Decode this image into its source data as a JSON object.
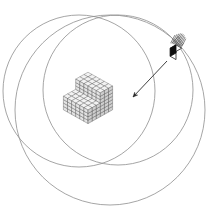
{
  "figure": {
    "title": "Three overlapping circles with voxel assembly and source cube",
    "background_color": "#ffffff",
    "width": 215,
    "height": 219,
    "caption": ""
  },
  "style": {
    "circle_stroke": "#8e8e8e",
    "circle_stroke_width": 0.8,
    "voxel_line": "#3c3c3c",
    "voxel_top_fill": "#f2f2f2",
    "voxel_left_fill": "#cfcfcf",
    "voxel_right_fill": "#e4e4e4",
    "small_cube_dark_face": "#0d0d0d",
    "small_cube_light_face": "#ffffff",
    "arrow_color": "#2b2b2b",
    "hatch_color": "#555555"
  },
  "circles": [
    {
      "name": "circle-upper-left",
      "cx": 79,
      "cy": 91,
      "r": 76
    },
    {
      "name": "circle-upper-right",
      "cx": 118,
      "cy": 90,
      "r": 75
    },
    {
      "name": "circle-lower-center",
      "cx": 110,
      "cy": 110,
      "r": 95
    }
  ],
  "voxel_assembly": {
    "name": "stepped-voxel-structure",
    "origin_x": 88,
    "origin_y": 96,
    "cell_w": 4.1,
    "cell_h": 2.3,
    "cell_z": 3.4,
    "description": "stepped L-shaped block of unit cubes",
    "columns": [
      {
        "grid_x": 0,
        "grid_y": 0,
        "height": 7
      },
      {
        "grid_x": 1,
        "grid_y": 0,
        "height": 7
      },
      {
        "grid_x": 2,
        "grid_y": 0,
        "height": 7
      },
      {
        "grid_x": 3,
        "grid_y": 0,
        "height": 7
      },
      {
        "grid_x": 4,
        "grid_y": 0,
        "height": 7
      },
      {
        "grid_x": 5,
        "grid_y": 0,
        "height": 7
      },
      {
        "grid_x": 0,
        "grid_y": 1,
        "height": 7
      },
      {
        "grid_x": 1,
        "grid_y": 1,
        "height": 7
      },
      {
        "grid_x": 2,
        "grid_y": 1,
        "height": 7
      },
      {
        "grid_x": 3,
        "grid_y": 1,
        "height": 7
      },
      {
        "grid_x": 4,
        "grid_y": 1,
        "height": 7
      },
      {
        "grid_x": 5,
        "grid_y": 1,
        "height": 7
      },
      {
        "grid_x": 0,
        "grid_y": 2,
        "height": 7
      },
      {
        "grid_x": 1,
        "grid_y": 2,
        "height": 7
      },
      {
        "grid_x": 2,
        "grid_y": 2,
        "height": 7
      },
      {
        "grid_x": 3,
        "grid_y": 2,
        "height": 7
      },
      {
        "grid_x": 4,
        "grid_y": 2,
        "height": 7
      },
      {
        "grid_x": 5,
        "grid_y": 2,
        "height": 7
      },
      {
        "grid_x": 0,
        "grid_y": 3,
        "height": 4
      },
      {
        "grid_x": 1,
        "grid_y": 3,
        "height": 4
      },
      {
        "grid_x": 2,
        "grid_y": 3,
        "height": 4
      },
      {
        "grid_x": 3,
        "grid_y": 3,
        "height": 4
      },
      {
        "grid_x": 4,
        "grid_y": 3,
        "height": 4
      },
      {
        "grid_x": 5,
        "grid_y": 3,
        "height": 4
      },
      {
        "grid_x": 0,
        "grid_y": 4,
        "height": 4
      },
      {
        "grid_x": 1,
        "grid_y": 4,
        "height": 4
      },
      {
        "grid_x": 2,
        "grid_y": 4,
        "height": 4
      },
      {
        "grid_x": 3,
        "grid_y": 4,
        "height": 4
      },
      {
        "grid_x": 4,
        "grid_y": 4,
        "height": 4
      },
      {
        "grid_x": 5,
        "grid_y": 4,
        "height": 4
      },
      {
        "grid_x": 0,
        "grid_y": 5,
        "height": 4
      },
      {
        "grid_x": 1,
        "grid_y": 5,
        "height": 4
      },
      {
        "grid_x": 2,
        "grid_y": 5,
        "height": 4
      },
      {
        "grid_x": 3,
        "grid_y": 5,
        "height": 4
      },
      {
        "grid_x": 4,
        "grid_y": 5,
        "height": 4
      },
      {
        "grid_x": 5,
        "grid_y": 5,
        "height": 4
      }
    ]
  },
  "source_cube": {
    "name": "single-source-cube",
    "center_x": 176,
    "center_y": 53,
    "size": 11,
    "dark_face": "left",
    "hatch_count": 9
  },
  "arrow": {
    "name": "pointer-arrow",
    "x1": 167,
    "y1": 61,
    "x2": 133,
    "y2": 97,
    "head_size": 5
  }
}
